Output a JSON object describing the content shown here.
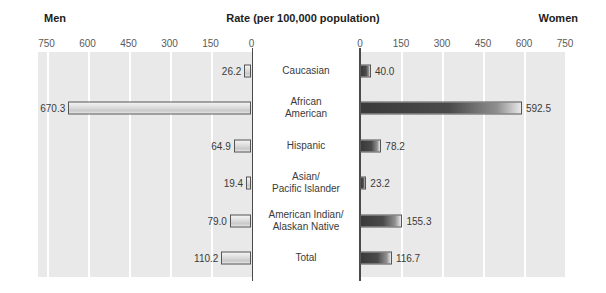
{
  "header": {
    "left_label": "Men",
    "right_label": "Women",
    "title": "Rate (per 100,000 population)",
    "category_header": "Race"
  },
  "axis": {
    "left_ticks": [
      "750",
      "600",
      "450",
      "300",
      "150",
      "0"
    ],
    "right_ticks": [
      "0",
      "150",
      "300",
      "450",
      "600",
      "750"
    ],
    "max": 750,
    "tick_step": 150
  },
  "chart_data": {
    "type": "bar",
    "orientation": "horizontal-diverging",
    "title": "Rate (per 100,000 population)",
    "xlabel": "Rate (per 100,000 population)",
    "ylabel": "Race",
    "xlim": [
      0,
      750
    ],
    "grid": true,
    "legend": "none",
    "categories": [
      "Caucasian",
      "African American",
      "Hispanic",
      "Asian/ Pacific Islander",
      "American Indian/ Alaskan Native",
      "Total"
    ],
    "series": [
      {
        "name": "Men",
        "side": "left",
        "values": [
          26.2,
          670.3,
          64.9,
          19.4,
          79.0,
          110.2
        ]
      },
      {
        "name": "Women",
        "side": "right",
        "values": [
          40.0,
          592.5,
          78.2,
          23.2,
          155.3,
          116.7
        ]
      }
    ]
  },
  "rows": [
    {
      "category_line1": "Caucasian",
      "category_line2": "",
      "men_value": 26.2,
      "men_label": "26.2",
      "women_value": 40.0,
      "women_label": "40.0"
    },
    {
      "category_line1": "African",
      "category_line2": "American",
      "men_value": 670.3,
      "men_label": "670.3",
      "women_value": 592.5,
      "women_label": "592.5"
    },
    {
      "category_line1": "Hispanic",
      "category_line2": "",
      "men_value": 64.9,
      "men_label": "64.9",
      "women_value": 78.2,
      "women_label": "78.2"
    },
    {
      "category_line1": "Asian/",
      "category_line2": "Pacific Islander",
      "men_value": 19.4,
      "men_label": "19.4",
      "women_value": 23.2,
      "women_label": "23.2"
    },
    {
      "category_line1": "American Indian/",
      "category_line2": "Alaskan Native",
      "men_value": 79.0,
      "men_label": "79.0",
      "women_value": 155.3,
      "women_label": "155.3"
    },
    {
      "category_line1": "Total",
      "category_line2": "",
      "men_value": 110.2,
      "men_label": "110.2",
      "women_value": 116.7,
      "women_label": "116.7"
    }
  ],
  "colors": {
    "panel_background": "#e9e9e9",
    "gridline": "#ffffff",
    "axis": "#4a4a4a",
    "men_bar": "#dcdcdc",
    "women_bar": "#3a3a3a",
    "text": "#3a3a3a"
  }
}
